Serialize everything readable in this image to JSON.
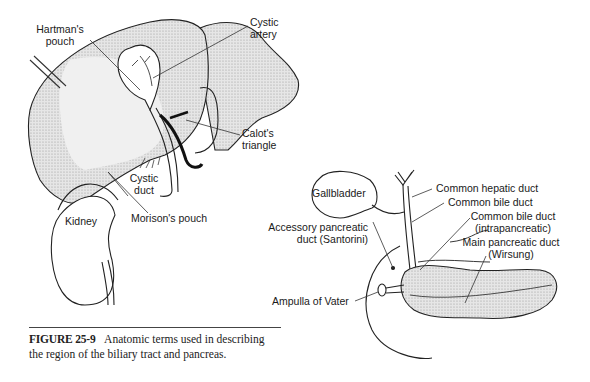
{
  "figure": {
    "number": "FIGURE 25-9",
    "caption_line1": "Anatomic terms used in describing",
    "caption_line2": "the region of the biliary tract and pancreas."
  },
  "left_diagram": {
    "labels": {
      "hartmans_pouch_1": "Hartman's",
      "hartmans_pouch_2": "pouch",
      "cystic_artery_1": "Cystic",
      "cystic_artery_2": "artery",
      "calots_triangle_1": "Calot's",
      "calots_triangle_2": "triangle",
      "cystic_duct_1": "Cystic",
      "cystic_duct_2": "duct",
      "kidney": "Kidney",
      "morisons_pouch": "Morison's pouch"
    }
  },
  "right_diagram": {
    "labels": {
      "gallbladder": "Gallbladder",
      "common_hepatic_duct": "Common hepatic duct",
      "common_bile_duct": "Common bile duct",
      "cbd_intra_1": "Common bile duct",
      "cbd_intra_2": "(intrapancreatic)",
      "accessory_1": "Accessory pancreatic",
      "accessory_2": "duct (Santorini)",
      "main_duct_1": "Main pancreatic duct",
      "main_duct_2": "(Wirsung)",
      "ampulla": "Ampulla of Vater"
    }
  }
}
